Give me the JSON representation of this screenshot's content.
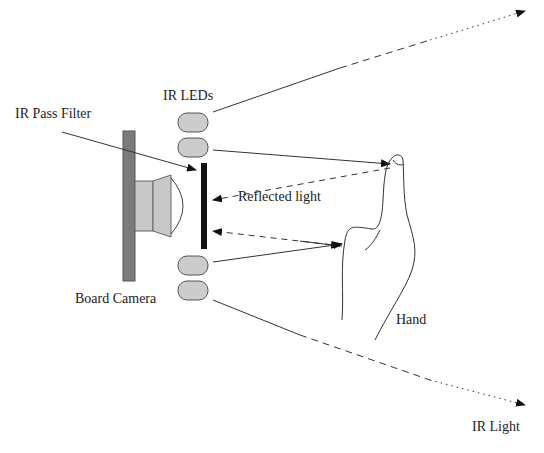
{
  "labels": {
    "ir_leds": "IR LEDs",
    "ir_pass_filter": "IR Pass Filter",
    "reflected_light": "Reflected light",
    "board_camera": "Board Camera",
    "hand": "Hand",
    "ir_light": "IR Light"
  },
  "colors": {
    "board": "#7a7a7a",
    "lens": "#c8c8c8",
    "led": "#cccccc",
    "filter": "#111111",
    "line": "#333333",
    "text": "#222222"
  }
}
